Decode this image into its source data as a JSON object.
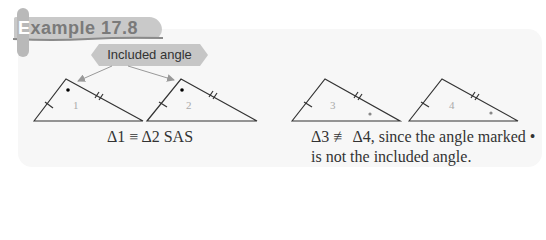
{
  "header": {
    "title_first_letter": "E",
    "title_rest": "xample 17.8"
  },
  "callout": {
    "label": "Included angle"
  },
  "triangles": [
    {
      "label": "1"
    },
    {
      "label": "2"
    },
    {
      "label": "3"
    },
    {
      "label": "4"
    }
  ],
  "captions": {
    "left": "Δ1 ≡ Δ2 SAS",
    "right_line1": "Δ3 ≢ Δ4, since the angle marked •",
    "right_line2": "is not the included angle."
  },
  "colors": {
    "banner": "#c9c9c9",
    "panel": "#f7f7f7",
    "arrow": "#999999"
  }
}
